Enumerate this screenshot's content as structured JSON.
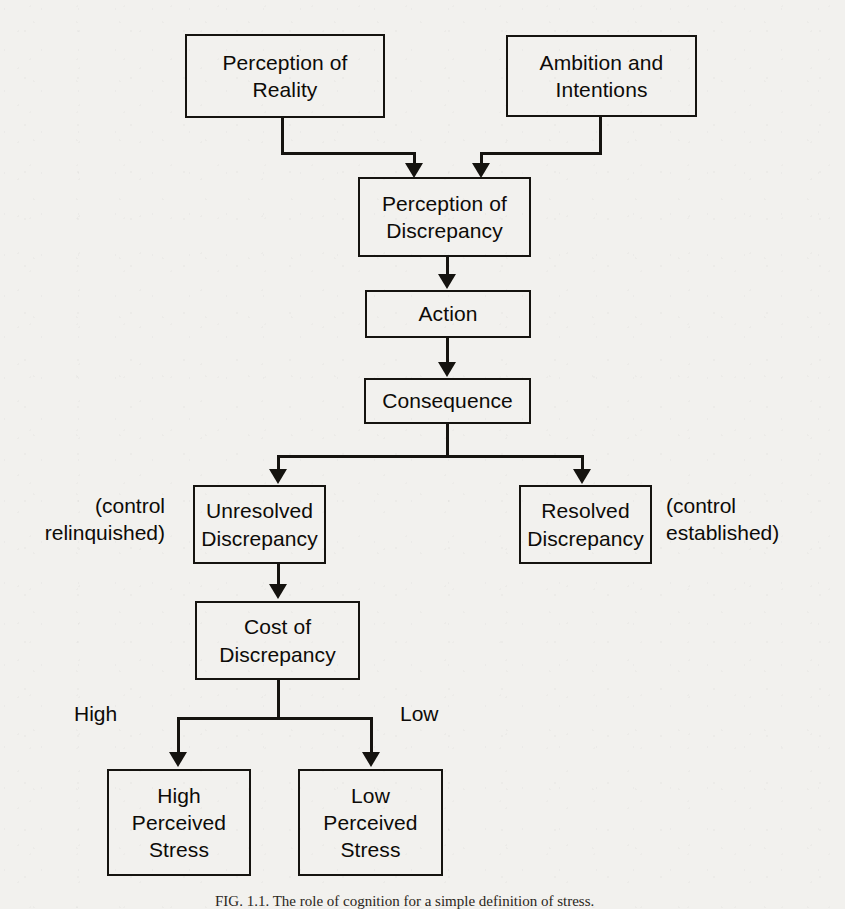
{
  "figure": {
    "title_caption": "FIG. 1.1.   The role of cognition for a simple definition of stress.",
    "background_color": "#f2f1ee",
    "line_color": "#15130f",
    "text_color": "#0d0b08"
  },
  "nodes": {
    "perception_of_reality": {
      "label": "Perception of\nReality"
    },
    "ambition_and_intentions": {
      "label": "Ambition and\nIntentions"
    },
    "perception_of_discrepancy": {
      "label": "Perception of\nDiscrepancy"
    },
    "action": {
      "label": "Action"
    },
    "consequence": {
      "label": "Consequence"
    },
    "unresolved_discrepancy": {
      "label": "Unresolved\nDiscrepancy"
    },
    "resolved_discrepancy": {
      "label": "Resolved\nDiscrepancy"
    },
    "cost_of_discrepancy": {
      "label": "Cost of\nDiscrepancy"
    },
    "high_perceived_stress": {
      "label": "High\nPerceived\nStress"
    },
    "low_perceived_stress": {
      "label": "Low\nPerceived\nStress"
    }
  },
  "annotations": {
    "control_relinquished": "(control\nrelinquished)",
    "control_established": "(control\nestablished)",
    "branch_high": "High",
    "branch_low": "Low"
  },
  "edges": [
    {
      "from": "perception_of_reality",
      "to": "perception_of_discrepancy"
    },
    {
      "from": "ambition_and_intentions",
      "to": "perception_of_discrepancy"
    },
    {
      "from": "perception_of_discrepancy",
      "to": "action"
    },
    {
      "from": "action",
      "to": "consequence"
    },
    {
      "from": "consequence",
      "to": "unresolved_discrepancy"
    },
    {
      "from": "consequence",
      "to": "resolved_discrepancy"
    },
    {
      "from": "unresolved_discrepancy",
      "to": "cost_of_discrepancy"
    },
    {
      "from": "cost_of_discrepancy",
      "to": "high_perceived_stress",
      "label": "High"
    },
    {
      "from": "cost_of_discrepancy",
      "to": "low_perceived_stress",
      "label": "Low"
    }
  ]
}
